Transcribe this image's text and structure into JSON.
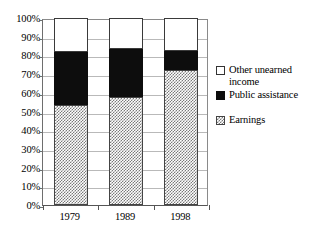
{
  "chart_data": {
    "type": "bar",
    "title": "",
    "subtitle": "",
    "xlabel": "",
    "ylabel": "",
    "stacked": true,
    "stack_mode": "percent",
    "grid": true,
    "legend_position": "right",
    "ylim": [
      0,
      100
    ],
    "categories": [
      "1979",
      "1989",
      "1998"
    ],
    "ytick_labels": [
      "0%",
      "10%",
      "20%",
      "30%",
      "40%",
      "50%",
      "60%",
      "70%",
      "80%",
      "90%",
      "100%"
    ],
    "ytick_values": [
      0,
      10,
      20,
      30,
      40,
      50,
      60,
      70,
      80,
      90,
      100
    ],
    "series": [
      {
        "name": "Earnings",
        "swatch": "hatched-gray",
        "values": [
          53.5,
          58.0,
          72.0
        ]
      },
      {
        "name": "Public assistance",
        "swatch": "solid-black",
        "values": [
          28.5,
          25.5,
          10.5
        ]
      },
      {
        "name": "Other unearned income",
        "swatch": "white-outline",
        "values": [
          18.0,
          16.5,
          17.5
        ]
      }
    ],
    "legend_entries": [
      {
        "label": "Other unearned\nincome",
        "swatch": "white-outline"
      },
      {
        "label": "Public assistance",
        "swatch": "solid-black"
      },
      {
        "label": "Earnings",
        "swatch": "hatched-gray"
      }
    ],
    "colors": {
      "earnings": "#7a7a7a",
      "public_assistance": "#0d0d0d",
      "other_unearned_income": "#ffffff",
      "gridline": "#b9b9b9",
      "axis": "#555555"
    }
  }
}
